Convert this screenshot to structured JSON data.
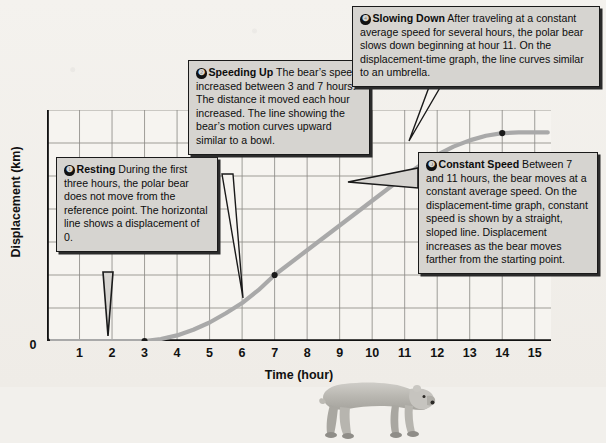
{
  "figure": {
    "background_color": "#f2f0ec"
  },
  "chart_data": {
    "type": "line",
    "title": "",
    "xlabel": "Time (hour)",
    "ylabel": "Displacement (km)",
    "xlim": [
      0,
      15.5
    ],
    "ylim": [
      0,
      70
    ],
    "xticks": [
      "0",
      "1",
      "2",
      "3",
      "4",
      "5",
      "6",
      "7",
      "8",
      "9",
      "10",
      "11",
      "12",
      "13",
      "14",
      "15"
    ],
    "yticks": [
      "0",
      "10",
      "20",
      "30",
      "40",
      "50",
      "60",
      "70"
    ],
    "grid": true,
    "legend": "none",
    "line_color": "#a9a9a9",
    "marker_color": "#1a1a1a",
    "series": [
      {
        "name": "Displacement",
        "x": [
          0,
          1,
          2,
          3,
          3.5,
          4,
          4.5,
          5,
          5.5,
          6,
          6.5,
          7,
          8,
          9,
          10,
          11,
          11.5,
          12,
          12.5,
          13,
          13.5,
          14,
          14.5,
          15,
          15.4
        ],
        "values": [
          0,
          0,
          0,
          0,
          0.6,
          1.7,
          3.4,
          5.6,
          8.4,
          11.5,
          15.4,
          20,
          27.5,
          35,
          42.5,
          50,
          53.4,
          56.4,
          58.9,
          60.8,
          62.2,
          63,
          63.2,
          63.2,
          63.2
        ]
      }
    ],
    "markers": [
      {
        "x": 0,
        "y": 0
      },
      {
        "x": 3,
        "y": 0
      },
      {
        "x": 7,
        "y": 20
      },
      {
        "x": 11,
        "y": 50
      },
      {
        "x": 14,
        "y": 63
      }
    ]
  },
  "callouts": [
    {
      "id": "callout-1",
      "number": "❶",
      "title": "Resting",
      "body": "During the first three hours, the polar bear does not move from the reference point. The horizontal line shows a displacement of 0."
    },
    {
      "id": "callout-2",
      "number": "❷",
      "title": "Speeding Up",
      "body": "The bear’s speed increased between 3 and 7 hours. The distance it moved each hour increased. The line showing the bear’s motion curves upward similar to a bowl."
    },
    {
      "id": "callout-3",
      "number": "❸",
      "title": "Constant Speed",
      "body": "Between 7 and 11 hours, the bear moves at a constant average speed. On the displacement-time graph, constant speed is shown by a straight, sloped line. Displacement increases as the bear moves farther from the starting point."
    },
    {
      "id": "callout-4",
      "number": "❹",
      "title": "Slowing Down",
      "body": "After traveling at a constant average speed for several hours, the polar bear slows down beginning at hour 11. On the displacement-time graph, the line curves similar to an umbrella."
    }
  ],
  "illustration": {
    "name": "polar-bear",
    "alt": "Walking polar bear"
  }
}
